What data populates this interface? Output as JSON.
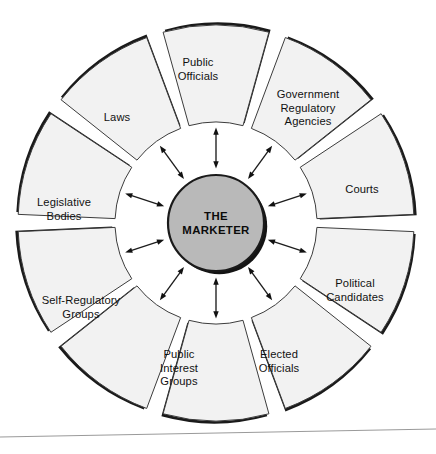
{
  "diagram": {
    "center": {
      "label": "THE\nMARKETER",
      "fill_color": "#b9b9b9",
      "stroke_color": "#1a1a1a",
      "cx": 216,
      "cy": 223,
      "r": 48
    },
    "geometry": {
      "cx": 216,
      "cy": 223,
      "outer_radius": 198,
      "inner_radius": 101,
      "segment_gap_degrees": 5,
      "segment_count": 10,
      "start_angle_degrees": -108
    },
    "style": {
      "segment_fill": "#f2f2f2",
      "segment_stroke": "#3c3c3c",
      "shadow_color": "#1a1a1a",
      "arrow_color": "#111111",
      "background": "#ffffff"
    },
    "arrows": {
      "kind": "double-headed",
      "count": 10,
      "description": "Bidirectional arrows connecting the central marketer hub to each surrounding segment"
    },
    "segments": [
      {
        "id": "public-officials",
        "label": "Public\nOfficials",
        "label_x": 198,
        "label_y": 70
      },
      {
        "id": "government-regulatory-agencies",
        "label": "Government\nRegulatory\nAgencies",
        "label_x": 308,
        "label_y": 108
      },
      {
        "id": "courts",
        "label": "Courts",
        "label_x": 362,
        "label_y": 190
      },
      {
        "id": "political-candidates",
        "label": "Political\nCandidates",
        "label_x": 355,
        "label_y": 291
      },
      {
        "id": "elected-officials",
        "label": "Elected\nOfficials",
        "label_x": 279,
        "label_y": 362
      },
      {
        "id": "public-interest-groups",
        "label": "Public\nInterest\nGroups",
        "label_x": 179,
        "label_y": 368
      },
      {
        "id": "self-regulatory-groups",
        "label": "Self-Regulatory\nGroups",
        "label_x": 81,
        "label_y": 308
      },
      {
        "id": "legislative-bodies",
        "label": "Legislative\nBodies",
        "label_x": 64,
        "label_y": 210
      },
      {
        "id": "laws",
        "label": "Laws",
        "label_x": 117,
        "label_y": 118
      }
    ],
    "footer_rule": {
      "present": true,
      "color": "#9a9a9a",
      "y_left": 437,
      "y_right": 429
    }
  }
}
